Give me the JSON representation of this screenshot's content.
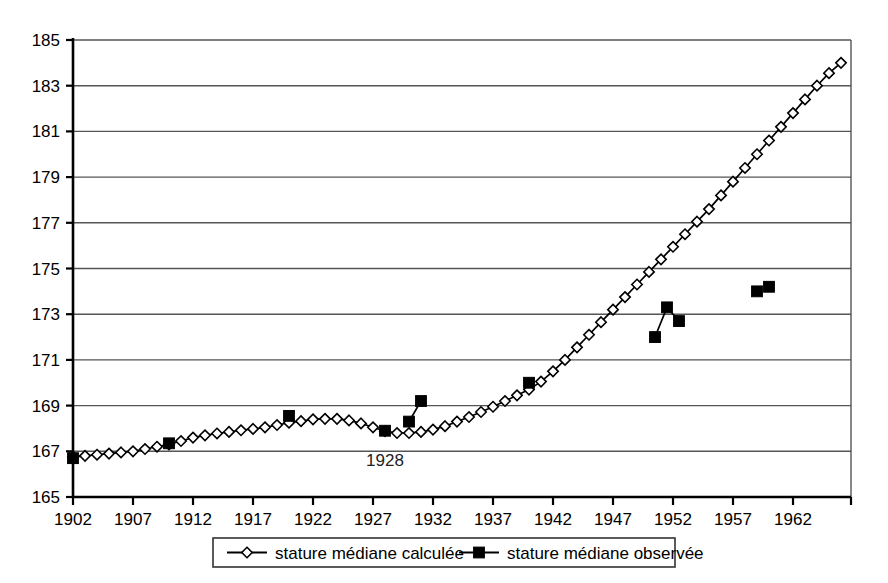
{
  "chart_data": {
    "type": "line",
    "title": "",
    "subtitle": "",
    "xlabel": "",
    "ylabel": "",
    "xlim": [
      1901,
      1966
    ],
    "ylim": [
      165,
      185
    ],
    "yticks": [
      165,
      167,
      169,
      171,
      173,
      175,
      177,
      179,
      181,
      183,
      185
    ],
    "xticks": [
      1902,
      1907,
      1912,
      1917,
      1922,
      1927,
      1932,
      1937,
      1942,
      1947,
      1952,
      1957,
      1962
    ],
    "xtick_labels": [
      "1902",
      "1907",
      "1912",
      "1917",
      "1922",
      "1927",
      "1932",
      "1937",
      "1942",
      "1947",
      "1952",
      "1957",
      "1962"
    ],
    "ytick_labels": [
      "165",
      "167",
      "169",
      "171",
      "173",
      "175",
      "177",
      "179",
      "181",
      "183",
      "185"
    ],
    "grid": "horizontal",
    "legend_position": "bottom",
    "annotations": [
      {
        "text": "1928",
        "x": 1928,
        "y": 166.35
      }
    ],
    "series": [
      {
        "name": "stature médiane calculée",
        "marker": "open-diamond",
        "line": true,
        "points": [
          {
            "x": 1902,
            "y": 166.75
          },
          {
            "x": 1903,
            "y": 166.8
          },
          {
            "x": 1904,
            "y": 166.85
          },
          {
            "x": 1905,
            "y": 166.9
          },
          {
            "x": 1906,
            "y": 166.95
          },
          {
            "x": 1907,
            "y": 167.0
          },
          {
            "x": 1908,
            "y": 167.1
          },
          {
            "x": 1909,
            "y": 167.2
          },
          {
            "x": 1910,
            "y": 167.3
          },
          {
            "x": 1911,
            "y": 167.45
          },
          {
            "x": 1912,
            "y": 167.6
          },
          {
            "x": 1913,
            "y": 167.7
          },
          {
            "x": 1914,
            "y": 167.78
          },
          {
            "x": 1915,
            "y": 167.85
          },
          {
            "x": 1916,
            "y": 167.92
          },
          {
            "x": 1917,
            "y": 167.98
          },
          {
            "x": 1918,
            "y": 168.05
          },
          {
            "x": 1919,
            "y": 168.15
          },
          {
            "x": 1920,
            "y": 168.25
          },
          {
            "x": 1921,
            "y": 168.32
          },
          {
            "x": 1922,
            "y": 168.4
          },
          {
            "x": 1923,
            "y": 168.42
          },
          {
            "x": 1924,
            "y": 168.42
          },
          {
            "x": 1925,
            "y": 168.35
          },
          {
            "x": 1926,
            "y": 168.22
          },
          {
            "x": 1927,
            "y": 168.05
          },
          {
            "x": 1928,
            "y": 167.88
          },
          {
            "x": 1929,
            "y": 167.8
          },
          {
            "x": 1930,
            "y": 167.8
          },
          {
            "x": 1931,
            "y": 167.85
          },
          {
            "x": 1932,
            "y": 167.95
          },
          {
            "x": 1933,
            "y": 168.1
          },
          {
            "x": 1934,
            "y": 168.3
          },
          {
            "x": 1935,
            "y": 168.5
          },
          {
            "x": 1936,
            "y": 168.72
          },
          {
            "x": 1937,
            "y": 168.95
          },
          {
            "x": 1938,
            "y": 169.2
          },
          {
            "x": 1939,
            "y": 169.45
          },
          {
            "x": 1940,
            "y": 169.7
          },
          {
            "x": 1941,
            "y": 170.05
          },
          {
            "x": 1942,
            "y": 170.5
          },
          {
            "x": 1943,
            "y": 171.0
          },
          {
            "x": 1944,
            "y": 171.55
          },
          {
            "x": 1945,
            "y": 172.1
          },
          {
            "x": 1946,
            "y": 172.65
          },
          {
            "x": 1947,
            "y": 173.2
          },
          {
            "x": 1948,
            "y": 173.75
          },
          {
            "x": 1949,
            "y": 174.3
          },
          {
            "x": 1950,
            "y": 174.85
          },
          {
            "x": 1951,
            "y": 175.4
          },
          {
            "x": 1952,
            "y": 175.95
          },
          {
            "x": 1953,
            "y": 176.5
          },
          {
            "x": 1954,
            "y": 177.05
          },
          {
            "x": 1955,
            "y": 177.6
          },
          {
            "x": 1956,
            "y": 178.2
          },
          {
            "x": 1957,
            "y": 178.8
          },
          {
            "x": 1958,
            "y": 179.4
          },
          {
            "x": 1959,
            "y": 180.0
          },
          {
            "x": 1960,
            "y": 180.6
          },
          {
            "x": 1961,
            "y": 181.2
          },
          {
            "x": 1962,
            "y": 181.8
          },
          {
            "x": 1963,
            "y": 182.4
          },
          {
            "x": 1964,
            "y": 183.0
          },
          {
            "x": 1965,
            "y": 183.55
          },
          {
            "x": 1966,
            "y": 184.0
          }
        ]
      },
      {
        "name": "stature médiane observée",
        "marker": "filled-square",
        "line": false,
        "points": [
          {
            "x": 1902,
            "y": 166.7
          },
          {
            "x": 1910,
            "y": 167.35
          },
          {
            "x": 1920,
            "y": 168.55
          },
          {
            "x": 1928,
            "y": 167.9
          },
          {
            "x": 1940,
            "y": 170.0
          },
          {
            "x": 1959,
            "y": 174.0
          },
          {
            "x": 1960,
            "y": 174.2
          }
        ],
        "segments": [
          {
            "points": [
              {
                "x": 1930,
                "y": 168.3
              },
              {
                "x": 1931,
                "y": 169.2
              }
            ]
          },
          {
            "points": [
              {
                "x": 1950.5,
                "y": 172.0
              },
              {
                "x": 1951.5,
                "y": 173.3
              },
              {
                "x": 1952.5,
                "y": 172.7
              }
            ]
          }
        ]
      }
    ]
  },
  "legend": {
    "items": [
      {
        "label": "stature médiane calculée",
        "marker": "open-diamond"
      },
      {
        "label": "stature médiane observée",
        "marker": "filled-square"
      }
    ]
  },
  "colors": {
    "line": "#000000",
    "grid": "#555555",
    "axis": "#000000",
    "background": "#ffffff",
    "marker_fill_open": "#ffffff",
    "marker_fill_solid": "#000000"
  }
}
